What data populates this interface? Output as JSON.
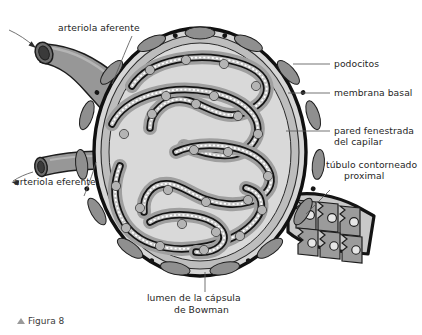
{
  "figure": {
    "caption_marker": "▲",
    "caption": "Figura 8",
    "cut_off_top_text": ""
  },
  "labels": {
    "afferent": "arteriola aferente",
    "efferent": "arteriola eferente",
    "podocytes": "podocitos",
    "basal_membrane": "membrana basal",
    "fenestrated_wall_l1": "pared fenestrada",
    "fenestrated_wall_l2": "del capilar",
    "tubule_l1": "túbulo contorneado",
    "tubule_l2": "proximal",
    "lumen_l1": "lumen de la cápsula",
    "lumen_l2": "de Bowman"
  },
  "colors": {
    "page_background": "#ffffff",
    "outline": "#141414",
    "capsule_wall": "#8c8c8c",
    "capsule_lumen": "#d3d3d3",
    "podocyte_layer": "#a3a3a3",
    "basal_membrane": "#1a1a1a",
    "capillary_lumen": "#c2c2c2",
    "fenestration": "#ffffff",
    "arteriole": "#909090",
    "arteriole_dark": "#4a4a4a",
    "tubule_cell": "#9b9b9b",
    "text": "#262626",
    "leader_line": "#5a5a5a",
    "caption_marker": "#9a9a9a"
  },
  "structures": [
    {
      "name": "afferent arteriole",
      "position": "upper-left",
      "label": "arteriola aferente"
    },
    {
      "name": "efferent arteriole",
      "position": "mid-left",
      "label": "arteriola eferente"
    },
    {
      "name": "Bowman capsule wall",
      "position": "outer circle",
      "label": "podocitos"
    },
    {
      "name": "basal membrane",
      "position": "capillary outline",
      "label": "membrana basal"
    },
    {
      "name": "fenestrated capillary wall",
      "position": "capillary inner",
      "label": "pared fenestrada del capilar"
    },
    {
      "name": "proximal convoluted tubule",
      "position": "right",
      "label": "túbulo contorneado proximal"
    },
    {
      "name": "Bowman capsule lumen",
      "position": "interior",
      "label": "lumen de la cápsula de Bowman"
    }
  ]
}
